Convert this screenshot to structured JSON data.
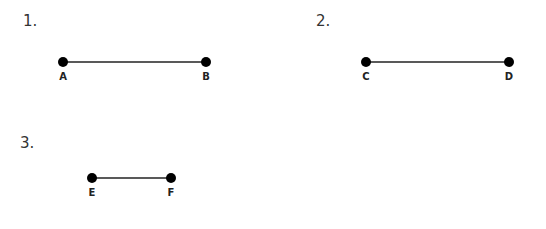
{
  "problems": [
    {
      "number": "1.",
      "points": [
        {
          "label": "A"
        },
        {
          "label": "B"
        }
      ]
    },
    {
      "number": "2.",
      "points": [
        {
          "label": "C"
        },
        {
          "label": "D"
        }
      ]
    },
    {
      "number": "3.",
      "points": [
        {
          "label": "E"
        },
        {
          "label": "F"
        }
      ]
    }
  ]
}
